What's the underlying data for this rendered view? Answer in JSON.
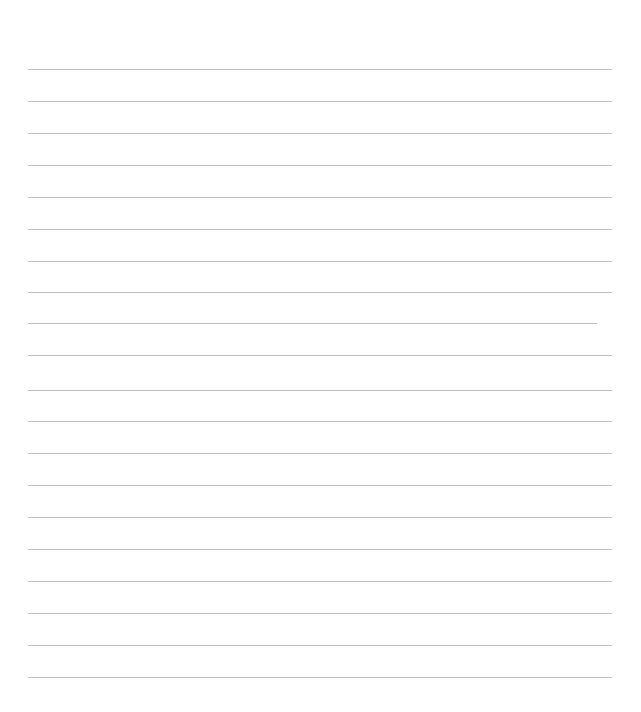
{
  "page": {
    "type": "lined-paper",
    "background": "#ffffff",
    "line_color": "#bdbdbd",
    "lines": [
      {
        "y": 69,
        "x1": 28,
        "x2": 612
      },
      {
        "y": 101,
        "x1": 28,
        "x2": 612
      },
      {
        "y": 133,
        "x1": 28,
        "x2": 612
      },
      {
        "y": 165,
        "x1": 28,
        "x2": 612
      },
      {
        "y": 197,
        "x1": 28,
        "x2": 612
      },
      {
        "y": 229,
        "x1": 28,
        "x2": 612
      },
      {
        "y": 261,
        "x1": 28,
        "x2": 612
      },
      {
        "y": 292,
        "x1": 28,
        "x2": 612
      },
      {
        "y": 323,
        "x1": 28,
        "x2": 597
      },
      {
        "y": 355,
        "x1": 28,
        "x2": 612
      },
      {
        "y": 390,
        "x1": 28,
        "x2": 612
      },
      {
        "y": 421,
        "x1": 28,
        "x2": 612
      },
      {
        "y": 453,
        "x1": 28,
        "x2": 612
      },
      {
        "y": 485,
        "x1": 28,
        "x2": 612
      },
      {
        "y": 517,
        "x1": 28,
        "x2": 612
      },
      {
        "y": 549,
        "x1": 28,
        "x2": 612
      },
      {
        "y": 581,
        "x1": 28,
        "x2": 612
      },
      {
        "y": 613,
        "x1": 28,
        "x2": 612
      },
      {
        "y": 645,
        "x1": 28,
        "x2": 612
      },
      {
        "y": 677,
        "x1": 28,
        "x2": 612
      }
    ]
  }
}
